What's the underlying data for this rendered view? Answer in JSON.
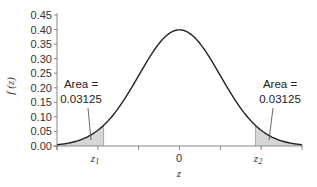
{
  "chart_data": {
    "type": "line",
    "title": "",
    "xlabel": "z",
    "ylabel": "f (z)",
    "xlim": [
      -3,
      3
    ],
    "ylim": [
      0,
      0.45
    ],
    "yticks": [
      "0.00",
      "0.05",
      "0.10",
      "0.15",
      "0.20",
      "0.25",
      "0.30",
      "0.35",
      "0.40",
      "0.45"
    ],
    "xticks": [
      {
        "value": -3,
        "label": ""
      },
      {
        "value": -2,
        "label": "z1"
      },
      {
        "value": -1,
        "label": ""
      },
      {
        "value": 0,
        "label": "0"
      },
      {
        "value": 1,
        "label": ""
      },
      {
        "value": 2,
        "label": "z2"
      },
      {
        "value": 3,
        "label": ""
      }
    ],
    "series": [
      {
        "name": "Standard normal density f(z)",
        "function": "exp(-z^2/2)/sqrt(2*pi)",
        "peak": 0.399
      }
    ],
    "shaded_regions": [
      {
        "from": -3,
        "to": -1.86,
        "label": "Area = 0.03125",
        "color": "#d9d9d9"
      },
      {
        "from": 1.86,
        "to": 3,
        "label": "Area = 0.03125",
        "color": "#d9d9d9"
      }
    ],
    "grid": false,
    "legend": "none"
  },
  "labels": {
    "ylabel_main": "f",
    "ylabel_arg": "(z)",
    "xlabel": "z",
    "z1_main": "z",
    "z1_sub": "1",
    "z2_main": "z",
    "z2_sub": "2",
    "zero": "0",
    "left_area_line1": "Area =",
    "left_area_line2": "0.03125",
    "right_area_line1": "Area =",
    "right_area_line2": "0.03125"
  },
  "colors": {
    "curve": "#222222",
    "shade": "#d6d6d6",
    "axis": "#888888"
  }
}
